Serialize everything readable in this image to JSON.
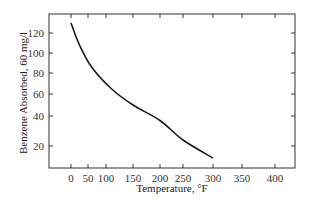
{
  "chart_data": {
    "type": "line",
    "title": "",
    "xlabel": "Temperature, °F",
    "ylabel": "Benzene Absorbed, 60 mg/l",
    "x_ticks": [
      0,
      50,
      100,
      150,
      200,
      250,
      300,
      350,
      400
    ],
    "y_ticks": [
      20,
      40,
      60,
      80,
      100,
      120
    ],
    "grid": false,
    "legend": null,
    "series": [
      {
        "name": "Benzene absorbed",
        "color": "#1a1a1a",
        "x": [
          0,
          25,
          60,
          110,
          150,
          200,
          250,
          300
        ],
        "y": [
          130,
          108,
          86,
          65,
          50,
          37,
          24,
          12
        ]
      }
    ]
  },
  "layout": {
    "frame": {
      "left": 49,
      "top": 14,
      "right": 295,
      "bottom": 168
    },
    "x_tick_px": {
      "0": 71,
      "50": 88,
      "100": 106,
      "150": 133,
      "200": 160,
      "250": 183,
      "300": 213,
      "350": 242,
      "400": 275
    },
    "y_tick_px": {
      "20": 146,
      "40": 116,
      "60": 94,
      "80": 73,
      "100": 53,
      "120": 33
    }
  }
}
